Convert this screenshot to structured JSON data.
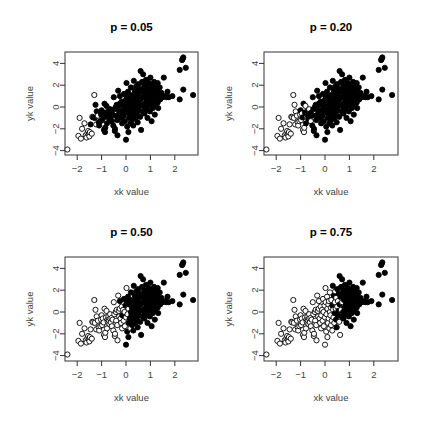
{
  "figure": {
    "layout": "2x2 grid",
    "point_color": "#000000",
    "background": "#ffffff"
  },
  "chart_data": {
    "type": "scatter",
    "title": "",
    "xlabel": "xk value",
    "ylabel": "yk value",
    "xlim": [
      -2.5,
      2.9
    ],
    "ylim": [
      -4.2,
      4.8
    ],
    "xticks": [
      -2,
      -1,
      0,
      1,
      2
    ],
    "yticks": [
      -4,
      -2,
      0,
      2,
      4
    ],
    "grid": false,
    "legend": null,
    "marker_legend": {
      "filled": "selected / retained point",
      "open": "non-selected point"
    },
    "panels": [
      {
        "title": "p = 0.05",
        "p": 0.05,
        "open_threshold_x": -1.4
      },
      {
        "title": "p = 0.20",
        "p": 0.2,
        "open_threshold_x": -0.88
      },
      {
        "title": "p = 0.50",
        "p": 0.5,
        "open_threshold_x": -0.05
      },
      {
        "title": "p = 0.75",
        "p": 0.75,
        "open_threshold_x": 0.52
      }
    ],
    "points": [
      [
        -2.4,
        -3.9
      ],
      [
        -1.95,
        -2.65
      ],
      [
        -1.9,
        -1.0
      ],
      [
        -1.85,
        -2.9
      ],
      [
        -1.8,
        -2.0
      ],
      [
        -1.7,
        -1.5
      ],
      [
        -1.65,
        -2.6
      ],
      [
        -1.62,
        -2.8
      ],
      [
        -1.58,
        -2.4
      ],
      [
        -1.55,
        -2.2
      ],
      [
        -1.52,
        -2.5
      ],
      [
        -1.5,
        -2.7
      ],
      [
        -1.48,
        -2.3
      ],
      [
        -1.45,
        -1.6
      ],
      [
        -1.4,
        -2.45
      ],
      [
        -1.38,
        -0.9
      ],
      [
        -1.35,
        -0.95
      ],
      [
        -1.3,
        1.1
      ],
      [
        -1.28,
        -1.0
      ],
      [
        -1.25,
        0.2
      ],
      [
        -1.22,
        -1.6
      ],
      [
        -1.2,
        -0.4
      ],
      [
        -1.15,
        -0.8
      ],
      [
        -1.12,
        -1.4
      ],
      [
        -1.1,
        -1.7
      ],
      [
        -1.05,
        -1.3
      ],
      [
        -1.02,
        -0.7
      ],
      [
        -1.0,
        -0.3
      ],
      [
        -0.98,
        -1.2
      ],
      [
        -0.95,
        -0.6
      ],
      [
        -0.92,
        -0.95
      ],
      [
        -0.9,
        -2.1
      ],
      [
        -0.88,
        0.3
      ],
      [
        -0.86,
        -2.3
      ],
      [
        -0.85,
        -1.9
      ],
      [
        -0.82,
        -0.5
      ],
      [
        -0.8,
        0.1
      ],
      [
        -0.78,
        -1.5
      ],
      [
        -0.76,
        -0.7
      ],
      [
        -0.75,
        -0.9
      ],
      [
        -0.72,
        -0.4
      ],
      [
        -0.7,
        -0.8
      ],
      [
        -0.68,
        -1.1
      ],
      [
        -0.66,
        -0.6
      ],
      [
        -0.65,
        -0.2
      ],
      [
        -0.62,
        -0.95
      ],
      [
        -0.6,
        -0.55
      ],
      [
        -0.58,
        -1.3
      ],
      [
        -0.55,
        -0.7
      ],
      [
        -0.52,
        -1.7
      ],
      [
        -0.5,
        0.9
      ],
      [
        -0.48,
        -0.2
      ],
      [
        -0.46,
        -2.2
      ],
      [
        -0.45,
        -2.0
      ],
      [
        -0.42,
        0.0
      ],
      [
        -0.4,
        -0.8
      ],
      [
        -0.38,
        0.2
      ],
      [
        -0.36,
        -1.2
      ],
      [
        -0.35,
        -2.6
      ],
      [
        -0.32,
        1.5
      ],
      [
        -0.3,
        0.1
      ],
      [
        -0.28,
        -0.4
      ],
      [
        -0.26,
        0.3
      ],
      [
        -0.25,
        1.0
      ],
      [
        -0.22,
        -0.6
      ],
      [
        -0.2,
        -1.0
      ],
      [
        -0.18,
        0.5
      ],
      [
        -0.16,
        -1.5
      ],
      [
        -0.15,
        -0.3
      ],
      [
        -0.12,
        0.2
      ],
      [
        -0.1,
        -0.8
      ],
      [
        -0.08,
        1.2
      ],
      [
        -0.06,
        0.0
      ],
      [
        -0.05,
        -1.3
      ],
      [
        -0.02,
        0.6
      ],
      [
        0.0,
        -0.5
      ],
      [
        0.0,
        -3.0
      ],
      [
        0.02,
        2.2
      ],
      [
        0.03,
        0.9
      ],
      [
        0.05,
        -1.8
      ],
      [
        0.06,
        -0.2
      ],
      [
        0.08,
        1.4
      ],
      [
        0.1,
        -2.3
      ],
      [
        0.1,
        0.3
      ],
      [
        0.12,
        -1.0
      ],
      [
        0.14,
        0.7
      ],
      [
        0.15,
        -0.6
      ],
      [
        0.16,
        1.0
      ],
      [
        0.18,
        -1.5
      ],
      [
        0.2,
        0.0
      ],
      [
        0.2,
        1.8
      ],
      [
        0.22,
        -0.3
      ],
      [
        0.24,
        0.4
      ],
      [
        0.25,
        -1.2
      ],
      [
        0.26,
        1.1
      ],
      [
        0.28,
        -0.8
      ],
      [
        0.3,
        0.6
      ],
      [
        0.3,
        -1.7
      ],
      [
        0.32,
        2.4
      ],
      [
        0.33,
        0.2
      ],
      [
        0.35,
        -0.5
      ],
      [
        0.36,
        1.5
      ],
      [
        0.38,
        -1.0
      ],
      [
        0.4,
        0.9
      ],
      [
        0.4,
        -0.1
      ],
      [
        0.42,
        1.9
      ],
      [
        0.44,
        0.3
      ],
      [
        0.45,
        -0.7
      ],
      [
        0.46,
        1.3
      ],
      [
        0.48,
        -1.4
      ],
      [
        0.5,
        0.5
      ],
      [
        0.5,
        2.1
      ],
      [
        0.52,
        -0.3
      ],
      [
        0.53,
        1.0
      ],
      [
        0.55,
        0.1
      ],
      [
        0.56,
        1.7
      ],
      [
        0.58,
        -0.9
      ],
      [
        0.6,
        3.3
      ],
      [
        0.6,
        0.7
      ],
      [
        0.62,
        -2.1
      ],
      [
        0.63,
        1.4
      ],
      [
        0.65,
        0.2
      ],
      [
        0.66,
        2.3
      ],
      [
        0.68,
        -0.4
      ],
      [
        0.7,
        0.9
      ],
      [
        0.7,
        3.0
      ],
      [
        0.72,
        1.6
      ],
      [
        0.74,
        0.0
      ],
      [
        0.75,
        2.0
      ],
      [
        0.76,
        -0.6
      ],
      [
        0.78,
        1.1
      ],
      [
        0.8,
        0.4
      ],
      [
        0.8,
        1.8
      ],
      [
        0.82,
        2.5
      ],
      [
        0.84,
        -0.2
      ],
      [
        0.85,
        1.3
      ],
      [
        0.86,
        0.7
      ],
      [
        0.88,
        -1.0
      ],
      [
        0.9,
        1.9
      ],
      [
        0.9,
        0.1
      ],
      [
        0.92,
        1.5
      ],
      [
        0.94,
        2.2
      ],
      [
        0.95,
        0.5
      ],
      [
        0.96,
        1.0
      ],
      [
        0.98,
        -0.4
      ],
      [
        1.0,
        2.7
      ],
      [
        1.0,
        1.7
      ],
      [
        1.02,
        0.3
      ],
      [
        1.04,
        1.2
      ],
      [
        1.05,
        -1.3
      ],
      [
        1.06,
        2.0
      ],
      [
        1.08,
        0.8
      ],
      [
        1.1,
        1.4
      ],
      [
        1.1,
        -0.1
      ],
      [
        1.12,
        1.8
      ],
      [
        1.14,
        0.6
      ],
      [
        1.15,
        2.3
      ],
      [
        1.16,
        1.0
      ],
      [
        1.18,
        -0.7
      ],
      [
        1.2,
        1.5
      ],
      [
        1.2,
        0.2
      ],
      [
        1.22,
        2.0
      ],
      [
        1.24,
        1.2
      ],
      [
        1.25,
        0.9
      ],
      [
        1.28,
        1.6
      ],
      [
        1.3,
        0.4
      ],
      [
        1.3,
        2.2
      ],
      [
        1.32,
        -0.1
      ],
      [
        1.35,
        1.0
      ],
      [
        1.38,
        1.8
      ],
      [
        1.4,
        0.7
      ],
      [
        1.45,
        1.3
      ],
      [
        1.5,
        0.9
      ],
      [
        1.55,
        2.7
      ],
      [
        1.6,
        1.0
      ],
      [
        1.65,
        0.9
      ],
      [
        1.7,
        1.4
      ],
      [
        1.75,
        0.9
      ],
      [
        1.9,
        1.0
      ],
      [
        2.2,
        0.7
      ],
      [
        2.2,
        3.4
      ],
      [
        2.3,
        4.3
      ],
      [
        2.32,
        4.4
      ],
      [
        2.35,
        4.55
      ],
      [
        2.35,
        1.6
      ],
      [
        2.45,
        3.6
      ],
      [
        2.75,
        1.1
      ]
    ],
    "point_count": 187
  }
}
